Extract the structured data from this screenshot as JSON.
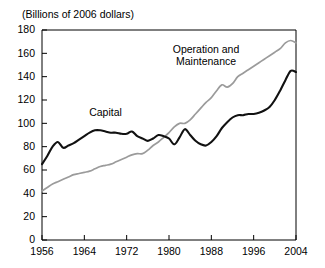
{
  "chart_data": {
    "type": "line",
    "title": "(Billions of 2006 dollars)",
    "xlabel": "",
    "ylabel": "",
    "xlim": [
      1956,
      2004
    ],
    "ylim": [
      0,
      180
    ],
    "grid": false,
    "legend_position": "inline-annotations",
    "xticks": [
      1956,
      1964,
      1972,
      1980,
      1988,
      1996,
      2004
    ],
    "yticks": [
      0,
      20,
      40,
      60,
      80,
      100,
      120,
      140,
      160,
      180
    ],
    "x": [
      1956,
      1957,
      1958,
      1959,
      1960,
      1961,
      1962,
      1963,
      1964,
      1965,
      1966,
      1967,
      1968,
      1969,
      1970,
      1971,
      1972,
      1973,
      1974,
      1975,
      1976,
      1977,
      1978,
      1979,
      1980,
      1981,
      1982,
      1983,
      1984,
      1985,
      1986,
      1987,
      1988,
      1989,
      1990,
      1991,
      1992,
      1993,
      1994,
      1995,
      1996,
      1997,
      1998,
      1999,
      2000,
      2001,
      2002,
      2003,
      2004
    ],
    "series": [
      {
        "name": "Capital",
        "color": "#111111",
        "values": [
          65,
          72,
          80,
          84,
          79,
          81,
          83,
          86,
          89,
          92,
          94,
          94,
          93,
          92,
          92,
          91,
          91,
          93,
          89,
          87,
          85,
          87,
          90,
          89,
          87,
          82,
          88,
          95,
          90,
          85,
          82,
          81,
          84,
          89,
          96,
          101,
          105,
          107,
          107,
          108,
          108,
          109,
          111,
          114,
          120,
          128,
          137,
          145,
          144
        ]
      },
      {
        "name": "Operation and Maintenance",
        "color": "#9b9b9b",
        "values": [
          42,
          45,
          48,
          50,
          52,
          54,
          56,
          57,
          58,
          59,
          61,
          63,
          64,
          65,
          67,
          69,
          71,
          73,
          74,
          74,
          77,
          81,
          84,
          88,
          92,
          97,
          100,
          100,
          103,
          108,
          113,
          118,
          122,
          128,
          133,
          131,
          134,
          140,
          143,
          146,
          149,
          152,
          155,
          158,
          161,
          164,
          169,
          171,
          169
        ]
      }
    ],
    "annotations": [
      {
        "text": "Capital",
        "x_ref": 1968,
        "y_ref": 106
      },
      {
        "text": "Operation and",
        "x_ref": 1987,
        "y_ref": 160
      },
      {
        "text": "Maintenance",
        "x_ref": 1987,
        "y_ref": 150
      }
    ]
  }
}
